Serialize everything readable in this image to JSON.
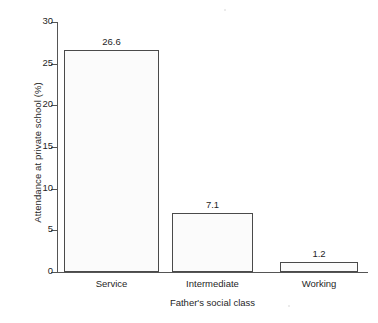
{
  "chart_data": {
    "type": "bar",
    "title": "",
    "categories": [
      "Service",
      "Intermediate",
      "Working"
    ],
    "values": [
      26.6,
      7.1,
      1.2
    ],
    "value_labels": [
      "26.6",
      "7.1",
      "1.2"
    ],
    "xlabel": "Father's social class",
    "ylabel": "Attendance at private school (%)",
    "ylim": [
      0,
      30
    ],
    "yticks": [
      0,
      5,
      10,
      15,
      20,
      25,
      30
    ],
    "ytick_labels": [
      "0",
      "5",
      "10",
      "15",
      "20",
      "25",
      "30"
    ],
    "grid": false,
    "legend": false,
    "legend_position": "none",
    "bar_fill_color": "#fbfbfb",
    "bar_edge_color": "#4a4a4a",
    "axis_color": "#555555",
    "background_color": "#ffffff"
  },
  "axes": {
    "y_title": "Attendance at private school (%)",
    "x_title": "Father's social class"
  },
  "ticks": {
    "y": [
      {
        "value": 30,
        "label": "30"
      },
      {
        "value": 25,
        "label": "25"
      },
      {
        "value": 20,
        "label": "20"
      },
      {
        "value": 15,
        "label": "15"
      },
      {
        "value": 10,
        "label": "10"
      },
      {
        "value": 5,
        "label": "5"
      },
      {
        "value": 0,
        "label": "0"
      }
    ]
  },
  "bars": [
    {
      "category": "Service",
      "value": 26.6,
      "label": "26.6"
    },
    {
      "category": "Intermediate",
      "value": 7.1,
      "label": "7.1"
    },
    {
      "category": "Working",
      "value": 1.2,
      "label": "1.2"
    }
  ]
}
